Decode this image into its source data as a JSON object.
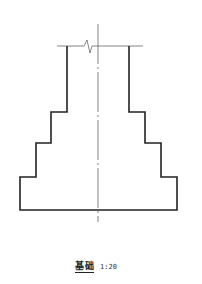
{
  "drawing": {
    "title": "基础",
    "scale": "1:20",
    "colors": {
      "outline": "#222222",
      "thin": "#777777",
      "background": "#ffffff"
    }
  }
}
